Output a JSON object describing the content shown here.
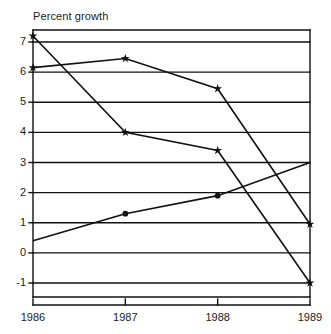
{
  "chart_data": {
    "type": "line",
    "title": "Percent growth",
    "xlabel": "",
    "ylabel": "",
    "categories": [
      "1986",
      "1987",
      "1988",
      "1989"
    ],
    "x": [
      1986,
      1987,
      1988,
      1989
    ],
    "ylim": [
      -1.4,
      7.6
    ],
    "xlim": [
      1986,
      1989
    ],
    "grid": true,
    "gridlines_y": [
      7,
      6,
      5,
      4,
      3,
      2,
      1,
      0,
      -1
    ],
    "legend": "none",
    "legend_position": "none",
    "ytick_labels": [
      "7",
      "6",
      "5",
      "4",
      "3",
      "2",
      "1",
      "0",
      "-1"
    ],
    "ytick_values": [
      7,
      6,
      5,
      4,
      3,
      2,
      1,
      0,
      -1
    ],
    "xtick_labels": [
      "1986",
      "1987",
      "1988",
      "1989"
    ],
    "series": [
      {
        "name": "series-1",
        "marker": "star",
        "values": [
          7.2,
          4.0,
          3.4,
          -1.0
        ]
      },
      {
        "name": "series-2",
        "marker": "star",
        "values": [
          6.15,
          6.45,
          5.45,
          0.95
        ]
      },
      {
        "name": "series-3",
        "marker": "dot",
        "values": [
          0.4,
          1.3,
          1.9,
          3.0
        ]
      }
    ],
    "line_color": "#111111",
    "marker_color": "#111111",
    "grid_color": "#111111",
    "background": "#ffffff"
  }
}
